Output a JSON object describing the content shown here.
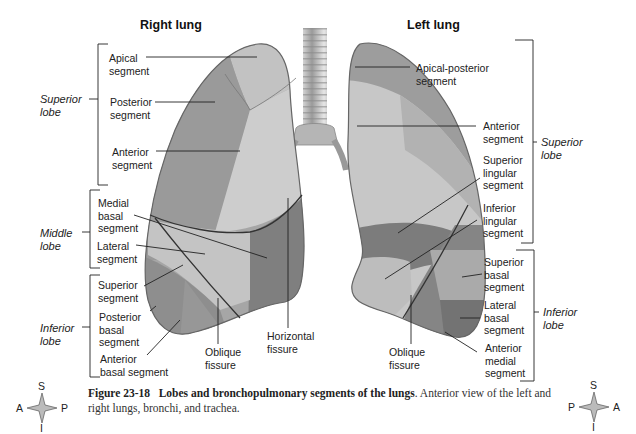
{
  "titles": {
    "right_lung": "Right lung",
    "left_lung": "Left lung"
  },
  "right_lung": {
    "lobes": [
      {
        "label": "Superior lobe",
        "line1": "Superior",
        "line2": "lobe"
      },
      {
        "label": "Middle lobe",
        "line1": "Middle",
        "line2": "lobe"
      },
      {
        "label": "Inferior lobe",
        "line1": "Inferior",
        "line2": "lobe"
      }
    ],
    "segments": [
      {
        "line1": "Apical",
        "line2": "segment"
      },
      {
        "line1": "Posterior",
        "line2": "segment"
      },
      {
        "line1": "Anterior",
        "line2": "segment"
      },
      {
        "line1": "Medial",
        "line2": "basal",
        "line3": "segment"
      },
      {
        "line1": "Lateral",
        "line2": "segment"
      },
      {
        "line1": "Superior",
        "line2": "segment"
      },
      {
        "line1": "Posterior",
        "line2": "basal",
        "line3": "segment"
      },
      {
        "line1": "Anterior",
        "line2": "basal segment"
      }
    ],
    "fissures": [
      {
        "line1": "Oblique",
        "line2": "fissure"
      },
      {
        "line1": "Horizontal",
        "line2": "fissure"
      }
    ]
  },
  "left_lung": {
    "lobes": [
      {
        "label": "Superior lobe",
        "line1": "Superior",
        "line2": "lobe"
      },
      {
        "label": "Inferior lobe",
        "line1": "Inferior",
        "line2": "lobe"
      }
    ],
    "segments": [
      {
        "line1": "Apical-posterior",
        "line2": "segment"
      },
      {
        "line1": "Anterior",
        "line2": "segment"
      },
      {
        "line1": "Superior",
        "line2": "lingular",
        "line3": "segment"
      },
      {
        "line1": "Inferior",
        "line2": "lingular",
        "line3": "segment"
      },
      {
        "line1": "Superior",
        "line2": "basal",
        "line3": "segment"
      },
      {
        "line1": "Lateral",
        "line2": "basal",
        "line3": "segment"
      },
      {
        "line1": "Anterior",
        "line2": "medial",
        "line3": "segment"
      }
    ],
    "fissures": [
      {
        "line1": "Oblique",
        "line2": "fissure"
      }
    ]
  },
  "compass_left": {
    "top": "S",
    "bottom": "I",
    "left": "A",
    "right": "P"
  },
  "compass_right": {
    "top": "S",
    "bottom": "I",
    "left": "P",
    "right": "A"
  },
  "caption": {
    "figure_number": "Figure 23-18",
    "title": "Lobes and bronchopulmonary segments of the lungs",
    "text": ". Anterior view of the left and right lungs, bronchi, and trachea."
  },
  "colors": {
    "light_segment": "#c8c8c8",
    "mid_segment": "#a8a8a8",
    "dark_segment": "#7e7e7e",
    "outline": "#555555"
  }
}
